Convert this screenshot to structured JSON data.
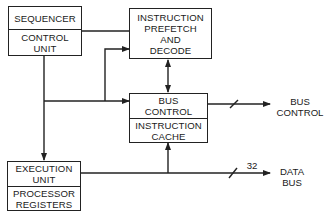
{
  "blocks": {
    "control": {
      "top": "SEQUENCER",
      "bottom_line1": "CONTROL",
      "bottom_line2": "UNIT"
    },
    "prefetch": {
      "line1": "INSTRUCTION",
      "line2": "PREFETCH",
      "line3": "AND",
      "line4": "DECODE"
    },
    "bus": {
      "top_line1": "BUS",
      "top_line2": "CONTROL",
      "bottom_line1": "INSTRUCTION",
      "bottom_line2": "CACHE"
    },
    "execution": {
      "top_line1": "EXECUTION",
      "top_line2": "UNIT",
      "bottom_line1": "PROCESSOR",
      "bottom_line2": "REGISTERS"
    }
  },
  "outputs": {
    "bus_control": {
      "line1": "BUS",
      "line2": "CONTROL"
    },
    "data_bus": {
      "line1": "DATA",
      "line2": "BUS",
      "width": "32"
    }
  },
  "colors": {
    "line": "#222222",
    "background": "#ffffff"
  }
}
